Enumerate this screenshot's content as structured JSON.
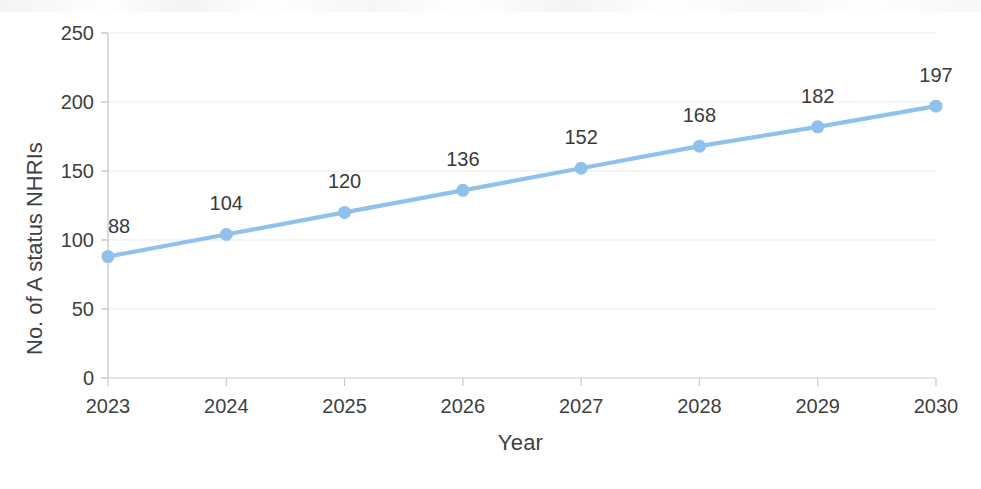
{
  "chart_data": {
    "type": "line",
    "title": "",
    "subtitle": "",
    "xlabel": "Year",
    "ylabel": "No. of A status NHRIs",
    "categories": [
      "2023",
      "2024",
      "2025",
      "2026",
      "2027",
      "2028",
      "2029",
      "2030"
    ],
    "x": [
      2023,
      2024,
      2025,
      2026,
      2027,
      2028,
      2029,
      2030
    ],
    "values": [
      88,
      104,
      120,
      136,
      152,
      168,
      182,
      197
    ],
    "data_labels": [
      "88",
      "104",
      "120",
      "136",
      "152",
      "168",
      "182",
      "197"
    ],
    "series": [
      {
        "name": "No. of A status NHRIs",
        "values": [
          88,
          104,
          120,
          136,
          152,
          168,
          182,
          197
        ],
        "color": "#8fc1ec",
        "marker": "circle",
        "show_data_labels": true
      }
    ],
    "ylim": [
      0,
      250
    ],
    "xlim": [
      2023,
      2030
    ],
    "y_ticks": [
      0,
      50,
      100,
      150,
      200,
      250
    ],
    "y_tick_labels": [
      "0",
      "50",
      "100",
      "150",
      "200",
      "250"
    ],
    "x_ticks": [
      2023,
      2024,
      2025,
      2026,
      2027,
      2028,
      2029,
      2030
    ],
    "x_tick_labels": [
      "2023",
      "2024",
      "2025",
      "2026",
      "2027",
      "2028",
      "2029",
      "2030"
    ],
    "grid": {
      "horizontal": true,
      "vertical": false,
      "color": "#ebebeb"
    },
    "legend": {
      "visible": false,
      "position": "none",
      "entries": []
    },
    "colors": {
      "line": "#8fc1ec",
      "marker": "#8fc1ec",
      "text": "#3f3f3f",
      "data_label": "#3a3a3a",
      "gridline": "#ebebeb",
      "axis": "#bfbfbf",
      "background": "#ffffff"
    }
  }
}
